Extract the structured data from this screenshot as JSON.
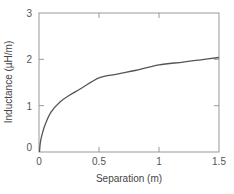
{
  "chart_data": {
    "type": "line",
    "title": "",
    "xlabel": "Separation (m)",
    "ylabel": "Inductance (µH/m)",
    "xlim": [
      0,
      1.5
    ],
    "ylim": [
      0,
      3
    ],
    "xticks": [
      0,
      0.5,
      1,
      1.5
    ],
    "xtick_labels": [
      "0",
      "0.5",
      "1",
      "1.5"
    ],
    "yticks": [
      0,
      1,
      2,
      3
    ],
    "ytick_labels": [
      "0",
      "1",
      "2",
      "3"
    ],
    "grid": false,
    "legend": null,
    "series": [
      {
        "name": "Inductance",
        "x": [
          0.004,
          0.01,
          0.02,
          0.05,
          0.1,
          0.175,
          0.25,
          0.35,
          0.5,
          0.65,
          0.8,
          1.0,
          1.2,
          1.35,
          1.5
        ],
        "values": [
          0.0,
          0.18,
          0.32,
          0.58,
          0.86,
          1.08,
          1.22,
          1.37,
          1.6,
          1.68,
          1.76,
          1.88,
          1.94,
          1.99,
          2.04
        ]
      }
    ]
  },
  "colors": {
    "line": "#555555",
    "axis": "#999999",
    "text": "#555555"
  }
}
